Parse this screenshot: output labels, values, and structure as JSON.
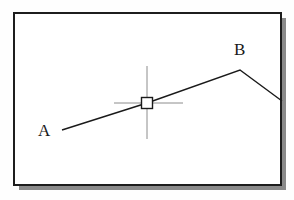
{
  "canvas": {
    "width": 294,
    "height": 200,
    "background_color": "#fefefe"
  },
  "frame": {
    "name": "drawing-border",
    "x": 14,
    "y": 13,
    "width": 267,
    "height": 172,
    "stroke_color": "#1d1d1d",
    "stroke_width": 2,
    "fill_color": "#ffffff",
    "shadow_color": "#8a8a8a",
    "shadow_offset_x": 5,
    "shadow_offset_y": 5
  },
  "drawing": {
    "polyline": {
      "name": "line-segment-a-b",
      "stroke_color": "#1a1a1a",
      "stroke_width": 1.4,
      "points": "62,130 147,103 240,70 282,101"
    },
    "vertices": [
      {
        "id": "A",
        "label": "A",
        "x": 62,
        "y": 130
      },
      {
        "id": "B",
        "label": "B",
        "x": 240,
        "y": 70
      }
    ]
  },
  "labels": {
    "point_a": "A",
    "point_b": "B"
  },
  "cursor": {
    "name": "crosshair-cursor",
    "center_x": 147,
    "center_y": 103,
    "crosshair_color": "#8c8c8c",
    "crosshair_width": 1,
    "horizontal_start_x": 114,
    "horizontal_end_x": 183,
    "vertical_start_y": 66,
    "vertical_end_y": 139,
    "pickbox": {
      "name": "pickbox",
      "size": 11,
      "stroke_color": "#1a1a1a",
      "stroke_width": 1.4,
      "fill_color": "#ffffff"
    }
  }
}
